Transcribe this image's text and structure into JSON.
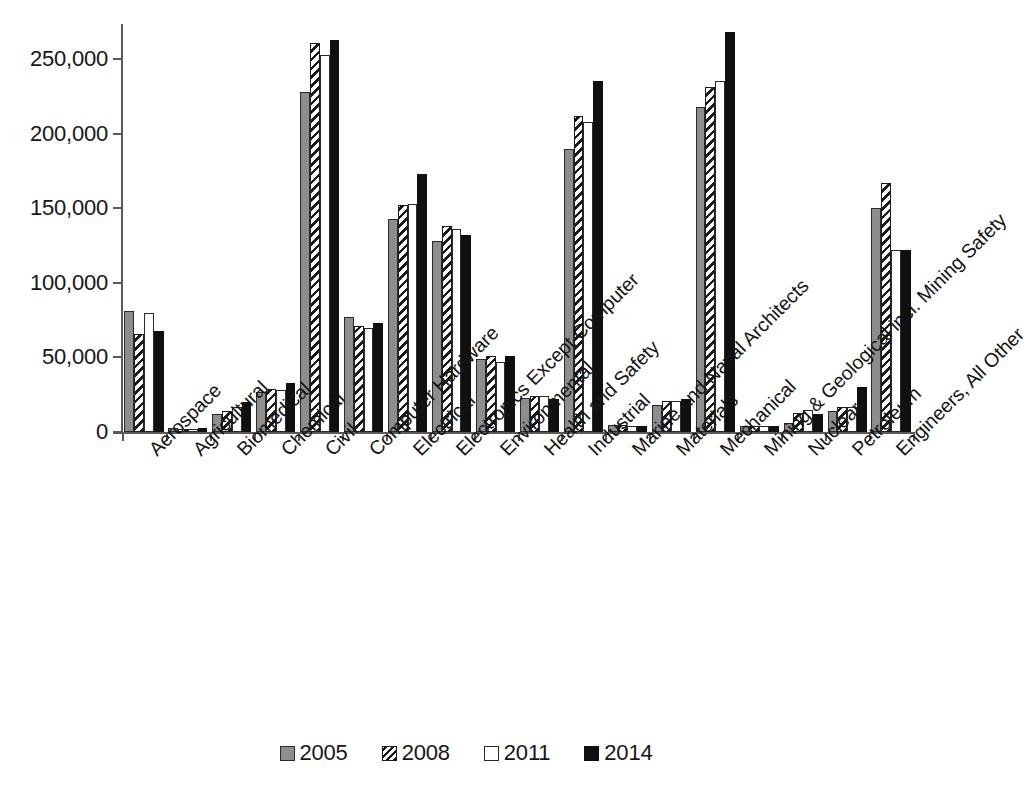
{
  "chart_data": {
    "type": "bar",
    "title": "",
    "subtitle": "",
    "xlabel": "",
    "ylabel": "",
    "ylim": [
      0,
      270000
    ],
    "yticks": [
      0,
      50000,
      100000,
      150000,
      200000,
      250000
    ],
    "ytick_labels": [
      "0",
      "50,000",
      "100,000",
      "150,000",
      "200,000",
      "250,000"
    ],
    "grid": false,
    "legend_position": "bottom",
    "categories": [
      "Aerospace",
      "Agricultural",
      "Biomedical",
      "Chemical",
      "Civil",
      "Computer Hardware",
      "Electrical",
      "Electronics Except Computer",
      "Environmental",
      "Health and Safety",
      "Industrial",
      "Marine and Naval Architects",
      "Materials",
      "Mechanical",
      "Mining & Geological incl. Mining Safety",
      "Nuclear",
      "Petroleum",
      "Engineers, All Other"
    ],
    "series": [
      {
        "name": "2005",
        "color": "#8d8d8d",
        "pattern": "solid-gray",
        "values": [
          81000,
          2800,
          12000,
          27000,
          228000,
          77000,
          143000,
          128000,
          49000,
          23000,
          190000,
          4500,
          18000,
          218000,
          4000,
          6000,
          14000,
          150000
        ]
      },
      {
        "name": "2008",
        "color": "#ffffff",
        "pattern": "diagonal-hatch",
        "values": [
          66000,
          2200,
          14000,
          29000,
          261000,
          71000,
          152000,
          138000,
          51000,
          24000,
          212000,
          4800,
          21000,
          231000,
          4200,
          13000,
          17000,
          167000
        ]
      },
      {
        "name": "2011",
        "color": "#ffffff",
        "pattern": "open",
        "values": [
          80000,
          2300,
          17000,
          28000,
          253000,
          70000,
          153000,
          136000,
          47000,
          24000,
          208000,
          3800,
          21000,
          235000,
          3800,
          15000,
          17000,
          122000
        ]
      },
      {
        "name": "2014",
        "color": "#101010",
        "pattern": "solid-black",
        "values": [
          68000,
          2500,
          20000,
          33000,
          263000,
          73000,
          173000,
          132000,
          51000,
          22000,
          235000,
          4000,
          22000,
          268000,
          4200,
          12000,
          30000,
          122000
        ]
      }
    ]
  },
  "legend": {
    "items": [
      {
        "label": "2005",
        "swatch": "solid-gray-swatch"
      },
      {
        "label": "2008",
        "swatch": "hatched-swatch"
      },
      {
        "label": "2011",
        "swatch": "open-swatch"
      },
      {
        "label": "2014",
        "swatch": "solid-black-swatch"
      }
    ]
  }
}
